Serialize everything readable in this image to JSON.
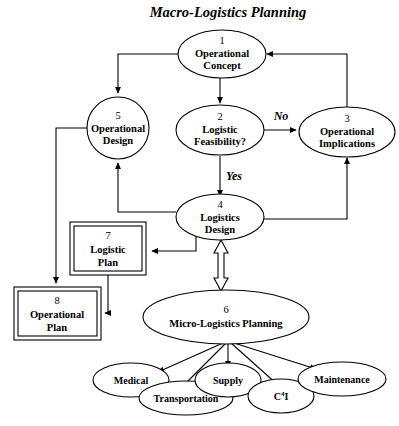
{
  "title": "Macro-Logistics Planning",
  "nodes": {
    "n1": {
      "num": "1",
      "line1": "Operational",
      "line2": "Concept"
    },
    "n2": {
      "num": "2",
      "line1": "Logistic",
      "line2": "Feasibility?"
    },
    "n3": {
      "num": "3",
      "line1": "Operational",
      "line2": "Implications"
    },
    "n4": {
      "num": "4",
      "line1": "Logistics",
      "line2": "Design"
    },
    "n5": {
      "num": "5",
      "line1": "Operational",
      "line2": "Design"
    },
    "n6": {
      "num": "6",
      "line1": "Micro-Logistics Planning",
      "line2": ""
    },
    "n7": {
      "num": "7",
      "line1": "Logistic",
      "line2": "Plan"
    },
    "n8": {
      "num": "8",
      "line1": "Operational",
      "line2": "Plan"
    }
  },
  "leaves": [
    {
      "id": "medical",
      "label": "Medical"
    },
    {
      "id": "transportation",
      "label": "Transportation"
    },
    {
      "id": "supply",
      "label": "Supply"
    },
    {
      "id": "c4i",
      "label": "C",
      "sup": "4",
      "label_tail": "I"
    },
    {
      "id": "maintenance",
      "label": "Maintenance"
    }
  ],
  "edge_labels": {
    "no": "No",
    "yes": "Yes"
  },
  "colors": {
    "stroke": "#000000",
    "fill": "#ffffff",
    "background": "#ffffff"
  }
}
